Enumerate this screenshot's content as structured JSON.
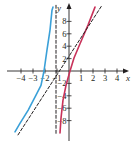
{
  "chart_data": {
    "type": "line",
    "title": "",
    "xlabel": "x",
    "ylabel": "y",
    "xlim": [
      -4.5,
      5
    ],
    "ylim": [
      -10.5,
      10.5
    ],
    "grid": false,
    "x_ticks": [
      -4,
      -3,
      -2,
      -1,
      1,
      2,
      3,
      4
    ],
    "x_tick_labels": [
      "−4",
      "−3",
      "−2",
      "−1",
      "1",
      "2",
      "3",
      "4"
    ],
    "y_ticks": [
      8,
      6,
      4,
      2,
      -2,
      -4,
      -6,
      -8
    ],
    "y_tick_labels": [
      "8",
      "6",
      "4",
      "2",
      "−2",
      "−4",
      "−6",
      "−8"
    ],
    "series": [
      {
        "name": "left branch",
        "color": "#3aa0d8",
        "style": "solid",
        "points": [
          [
            -4.5,
            -9.8
          ],
          [
            -4.1,
            -8.5
          ],
          [
            -3.4,
            -6.3
          ],
          [
            -2.75,
            -3.9
          ],
          [
            -2.33,
            -2.3
          ],
          [
            -2.08,
            0
          ],
          [
            -1.83,
            3.4
          ],
          [
            -1.58,
            6.6
          ],
          [
            -1.42,
            9.8
          ],
          [
            -1.33,
            10.3
          ]
        ]
      },
      {
        "name": "right branch",
        "color": "#c8325a",
        "style": "solid",
        "points": [
          [
            -0.75,
            -10
          ],
          [
            -0.67,
            -7.6
          ],
          [
            -0.5,
            -4.7
          ],
          [
            -0.25,
            -2.3
          ],
          [
            0.08,
            0
          ],
          [
            0.42,
            2.1
          ],
          [
            0.92,
            4.4
          ],
          [
            1.58,
            7.4
          ],
          [
            2.17,
            10.3
          ]
        ]
      },
      {
        "name": "vertical asymptote",
        "color": "#231f20",
        "style": "dashed",
        "points": [
          [
            -1.08,
            10.6
          ],
          [
            -1.08,
            -10.3
          ]
        ]
      },
      {
        "name": "slant asymptote",
        "color": "#231f20",
        "style": "dashed",
        "points": [
          [
            -4.25,
            -10.3
          ],
          [
            2.75,
            10.6
          ]
        ]
      }
    ]
  }
}
